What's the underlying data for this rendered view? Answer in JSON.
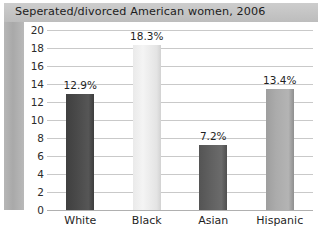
{
  "chart_data": {
    "type": "bar",
    "title": "Seperated/divorced American women, 2006",
    "xlabel": "",
    "ylabel": "",
    "categories": [
      "White",
      "Black",
      "Asian",
      "Hispanic"
    ],
    "values": [
      12.9,
      18.3,
      7.2,
      13.4
    ],
    "value_labels": [
      "12.9%",
      "18.3%",
      "7.2%",
      "13.4%"
    ],
    "bar_colors": [
      "#4a4a4a",
      "#eeeeee",
      "#606060",
      "#ababab"
    ],
    "ylim": [
      0,
      20
    ],
    "yticks": [
      20,
      18,
      16,
      14,
      12,
      10,
      8,
      6,
      4,
      2,
      0
    ],
    "ytick_labels": [
      "20",
      "18",
      "16",
      "14",
      "12",
      "10",
      "8",
      "6",
      "4",
      "2",
      "0"
    ],
    "grid": true,
    "legend": false,
    "legend_position": "none",
    "background_color": "#ffffff",
    "title_band_color": "#c6c6c6",
    "gridline_color": "#c9c9c9",
    "axis_wall_color": "#aeaeae"
  }
}
